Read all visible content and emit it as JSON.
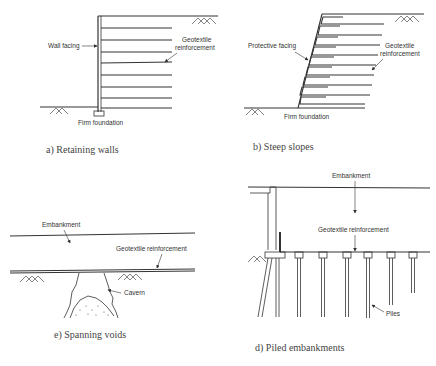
{
  "panels": {
    "a": {
      "caption": "a) Retaining walls",
      "labels": {
        "wall_facing": "Wall facing",
        "geotextile_1": "Geotextile",
        "geotextile_2": "reinforcement",
        "foundation": "Firm foundation"
      },
      "reinforcement_layers": 8
    },
    "b": {
      "caption": "b) Steep slopes",
      "labels": {
        "protective_facing": "Protective facing",
        "geotextile_1": "Geotextile",
        "geotextile_2": "reinforcement",
        "foundation": "Firm foundation"
      },
      "reinforcement_layers": 10
    },
    "c": {
      "caption": "e) Spanning voids",
      "labels": {
        "embankment": "Embankment",
        "geotextile": "Geotextile reinforcement",
        "cavern": "Cavern"
      }
    },
    "d": {
      "caption": "d) Piled embankments",
      "labels": {
        "embankment": "Embankment",
        "geotextile": "Geotextile reinforcement",
        "piles": "Piles"
      },
      "pile_count": 8
    }
  },
  "colors": {
    "line": "#333333",
    "text": "#333333",
    "background": "#ffffff"
  }
}
